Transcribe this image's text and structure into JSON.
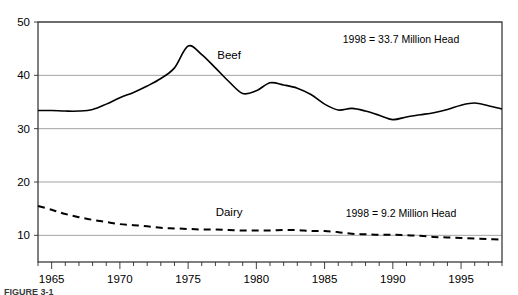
{
  "figure": {
    "caption": "FIGURE 3-1"
  },
  "chart_data": {
    "type": "line",
    "title": "",
    "xlabel": "",
    "ylabel": "",
    "xlim": [
      1964,
      1998
    ],
    "ylim": [
      5,
      50
    ],
    "grid": "horizontal",
    "legend": "inline-labels",
    "y_ticks": [
      10,
      20,
      30,
      40,
      50
    ],
    "y_tick_labels": [
      "10",
      "20",
      "30",
      "40",
      "50"
    ],
    "x_ticks": [
      1965,
      1970,
      1975,
      1980,
      1985,
      1990,
      1995
    ],
    "x_tick_labels": [
      "1965",
      "1970",
      "1975",
      "1980",
      "1985",
      "1990",
      "1995"
    ],
    "x_minor_tick_interval": 1,
    "x": [
      1964,
      1965,
      1966,
      1967,
      1968,
      1969,
      1970,
      1971,
      1972,
      1973,
      1974,
      1975,
      1976,
      1977,
      1978,
      1979,
      1980,
      1981,
      1982,
      1983,
      1984,
      1985,
      1986,
      1987,
      1988,
      1989,
      1990,
      1991,
      1992,
      1993,
      1994,
      1995,
      1996,
      1997,
      1998
    ],
    "series": [
      {
        "name": "Beef",
        "style": "solid",
        "color": "#000000",
        "label_x": 1978,
        "label_y": 43.0,
        "values": [
          33.4,
          33.4,
          33.3,
          33.3,
          33.6,
          34.6,
          35.8,
          36.8,
          38.0,
          39.4,
          41.4,
          45.5,
          43.9,
          41.4,
          38.8,
          36.6,
          37.1,
          38.6,
          38.2,
          37.6,
          36.4,
          34.6,
          33.5,
          33.8,
          33.3,
          32.5,
          31.7,
          32.2,
          32.6,
          33.0,
          33.6,
          34.4,
          34.8,
          34.3,
          33.7
        ]
      },
      {
        "name": "Dairy",
        "style": "dashed",
        "color": "#000000",
        "label_x": 1978,
        "label_y": 13.6,
        "values": [
          15.5,
          14.8,
          14.0,
          13.4,
          12.9,
          12.5,
          12.1,
          11.9,
          11.7,
          11.4,
          11.3,
          11.2,
          11.1,
          11.1,
          11.0,
          10.9,
          10.9,
          10.9,
          11.0,
          11.0,
          10.8,
          10.8,
          10.6,
          10.3,
          10.2,
          10.1,
          10.1,
          10.0,
          9.9,
          9.7,
          9.6,
          9.5,
          9.4,
          9.3,
          9.2
        ]
      }
    ],
    "annotations": [
      {
        "name": "beef-annotation",
        "text": "1998 = 33.7 Million Head",
        "x": 1990.6,
        "y": 46.1
      },
      {
        "name": "dairy-annotation",
        "text": "1998 = 9.2 Million Head",
        "x": 1990.6,
        "y": 13.5
      }
    ]
  }
}
